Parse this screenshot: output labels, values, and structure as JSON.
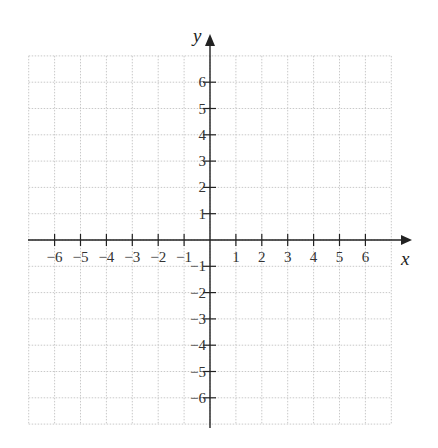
{
  "figure": {
    "type": "coordinate-plane",
    "x_axis_label": "x",
    "y_axis_label": "y",
    "x_range": [
      -7,
      7
    ],
    "y_range": [
      -7,
      7
    ],
    "grid": "dotted",
    "x_tick_labels": [
      "−6",
      "−5",
      "−4",
      "−3",
      "−2",
      "−1",
      "1",
      "2",
      "3",
      "4",
      "5",
      "6"
    ],
    "y_tick_labels": [
      "6",
      "5",
      "4",
      "3",
      "2",
      "1",
      "−1",
      "−2",
      "−3",
      "−4",
      "−5",
      "−6"
    ],
    "x_tick_values": [
      -6,
      -5,
      -4,
      -3,
      -2,
      -1,
      1,
      2,
      3,
      4,
      5,
      6
    ],
    "y_tick_values": [
      6,
      5,
      4,
      3,
      2,
      1,
      -1,
      -2,
      -3,
      -4,
      -5,
      -6
    ],
    "colors": {
      "axis": "#222222",
      "grid": "#c9c9c9",
      "labels": "#333333"
    }
  }
}
